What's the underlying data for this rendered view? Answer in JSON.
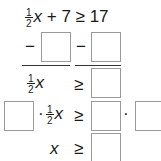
{
  "equation": {
    "frac_num": "1",
    "frac_den": "2",
    "variable": "x",
    "rest": " + 7 ≥ 17"
  },
  "step1": {
    "minus_left": "−",
    "minus_right": "−"
  },
  "step2": {
    "frac_num": "1",
    "frac_den": "2",
    "variable": "x",
    "relation": "≥"
  },
  "step3": {
    "dot_left": "·",
    "frac_num": "1",
    "frac_den": "2",
    "variable": "x",
    "relation": "≥",
    "dot_right": "·"
  },
  "step4": {
    "variable": "x",
    "relation": "≥"
  }
}
